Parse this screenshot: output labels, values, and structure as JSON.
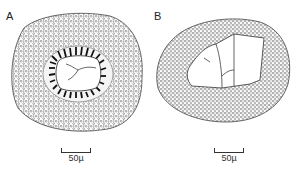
{
  "figure": {
    "panels": [
      {
        "id": "A",
        "label": "A",
        "description": "Cross-section with dense stippled outer cortex, ring of radially elongated dark cells around a clear central lumen containing branched strands",
        "scale_bar": {
          "label": "50µ",
          "length_um": 50
        }
      },
      {
        "id": "B",
        "label": "B",
        "description": "Oval cross-section with finely stippled wall and large irregular polygonal lumen divided by thin lines",
        "scale_bar": {
          "label": "50µ",
          "length_um": 50
        }
      }
    ],
    "colors": {
      "ink": "#222222",
      "background": "#ffffff",
      "stipple": "#555555"
    }
  }
}
